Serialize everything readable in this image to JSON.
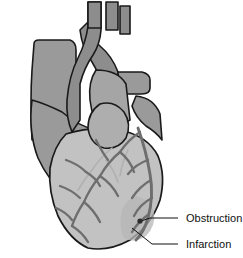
{
  "figure": {
    "background_color": "#ffffff"
  },
  "labels": [
    {
      "id": "obstruction",
      "text": "Obstruction",
      "text_x": 186,
      "text_y": 222,
      "leader_points": "178,218 150,218 141,221",
      "marker_x": 140,
      "marker_y": 221
    },
    {
      "id": "infarction",
      "text": "Infarction",
      "text_x": 186,
      "text_y": 248,
      "leader_points": "178,244 152,244 132,228",
      "marker_x": 131,
      "marker_y": 228
    }
  ],
  "anatomy": {
    "aorta": {
      "name": "aorta",
      "fill": "#8d8d8d",
      "path": "M101,2 L101,30 Q100,44 93,55 Q84,68 80,84 L80,120 L72,132 Q66,118 67,100 Q69,76 78,58 Q86,42 88,26 L88,2 Z"
    },
    "aortic-arch": {
      "name": "aortic-arch",
      "fill": "#8d8d8d",
      "path": "M88,22 Q90,38 100,46 Q112,56 118,72 L120,96 L104,96 Q100,74 92,62 Q82,48 80,30 Z"
    },
    "brachiocephalic-branch": {
      "name": "brachiocephalic-branch",
      "fill": "#8d8d8d",
      "path": "M88,2 L101,2 L101,28 L88,28 Z"
    },
    "carotid-branch": {
      "name": "left-common-carotid-branch",
      "fill": "#8d8d8d",
      "path": "M106,2 L118,2 L118,30 L106,30 Z"
    },
    "subclavian-branch": {
      "name": "left-subclavian-branch",
      "fill": "#8d8d8d",
      "path": "M120,6 L130,6 L130,34 L120,34 Z"
    },
    "superior-vena-cava": {
      "name": "superior-vena-cava",
      "fill": "#9a9a9a",
      "path": "M34,44 Q34,40 39,40 L70,40 Q76,42 76,50 L76,96 Q72,120 60,140 L32,140 Q30,100 32,70 Z"
    },
    "right-atrium": {
      "name": "right-atrium",
      "fill": "#9a9a9a",
      "path": "M32,100 Q28,132 38,158 Q48,180 66,196 L96,196 L96,130 Q78,126 62,112 Q46,104 32,100 Z"
    },
    "pulmonary-artery": {
      "name": "pulmonary-artery-trunk",
      "fill": "#a5a5a5",
      "path": "M96,70 Q118,70 126,84 L130,120 L104,134 Q92,120 90,100 Q88,82 96,70 Z"
    },
    "pulmonary-veins": {
      "name": "right-pulmonary-artery-branch",
      "fill": "#9a9a9a",
      "path": "M118,72 L142,72 Q150,74 150,80 L150,88 Q150,94 142,94 L120,94 Z"
    },
    "left-auricle": {
      "name": "left-atrial-appendage",
      "fill": "#aeaeae",
      "path": "M100,104 Q114,100 124,112 Q132,124 126,138 Q118,150 104,148 Q90,144 88,128 Q88,112 100,104 Z"
    },
    "right-auricle": {
      "name": "right-atrial-appendage",
      "fill": "#9a9a9a",
      "path": "M136,96 Q154,98 160,114 L162,140 Q156,132 146,126 Q136,118 132,106 Z"
    },
    "left-ventricle": {
      "name": "left-ventricle",
      "fill": "#c2c2c2",
      "path": "M66,134 Q92,126 120,130 Q148,136 158,156 Q166,176 160,200 Q152,224 130,240 Q108,252 88,248 Q70,240 58,216 Q48,192 50,168 Q54,146 66,134 Z"
    },
    "infarct-zone": {
      "name": "infarction-zone",
      "fill": "#b6b6b6",
      "path": "M136,196 Q150,200 154,212 Q156,226 146,236 Q134,244 124,238 Q118,226 122,210 Q126,200 136,196 Z"
    }
  },
  "vessels": {
    "stroke_color": "#6e6e6e",
    "light_stroke_color": "#b0b0b0",
    "outline_color": "#1a1a1a",
    "right_coronary_path": "M138,128 Q146,150 150,174 Q154,196 148,218 Q144,232 136,240",
    "branches": [
      "M148,160 Q136,164 128,174",
      "M151,180 Q140,186 132,198",
      "M152,198 Q140,204 134,216",
      "M149,214 Q138,222 132,232",
      "M140,132 Q128,140 120,152",
      "M120,152 Q108,162 100,176",
      "M100,176 Q90,188 84,202",
      "M84,202 Q76,214 72,226",
      "M100,176 Q112,184 118,196",
      "M84,202 Q94,210 100,222",
      "M120,152 Q130,160 134,172",
      "M72,226 Q82,232 88,242",
      "M66,160 Q78,164 86,172",
      "M86,172 Q96,178 100,186",
      "M60,186 Q72,190 80,198",
      "M56,208 Q66,212 72,220",
      "M96,140 Q102,152 108,160"
    ],
    "faint_branches": [
      "M112,148 Q100,158 92,170",
      "M92,170 Q84,180 78,190",
      "M106,160 Q114,170 118,182",
      "M128,150 Q122,162 120,176"
    ],
    "obstruction_marker_color": "#2a2a2a"
  }
}
